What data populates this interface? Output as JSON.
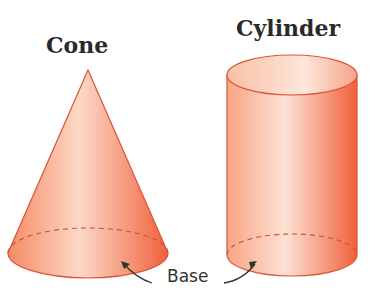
{
  "figures": [
    {
      "name": "cone",
      "title": "Cone"
    },
    {
      "name": "cylinder",
      "title": "Cylinder"
    }
  ],
  "base_label": "Base",
  "colors": {
    "fill_dark": "#f0643f",
    "fill_light": "#fbd8c6",
    "outline": "#d9553a",
    "text": "#2a2a2a"
  }
}
